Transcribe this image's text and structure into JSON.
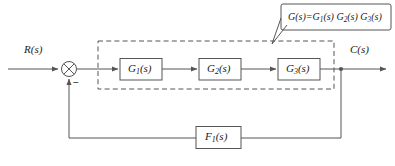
{
  "diagram": {
    "type": "control-system-block-diagram",
    "colors": {
      "line": "#555555",
      "block_border": "#555555",
      "dashed_border": "#555555",
      "text": "#1a1a1a",
      "background": "#ffffff"
    },
    "input": {
      "name": "input-signal",
      "label_html": "R(<i>s</i>)",
      "label": "R(s)"
    },
    "output": {
      "name": "output-signal",
      "label_html": "C(<i>s</i>)",
      "label": "C(s)"
    },
    "summing_junction": {
      "name": "summing-junction",
      "symbol": "crossed-circle",
      "negative_sign": "−",
      "positive_input": "R(s)",
      "negative_input": "F1(s) feedback"
    },
    "forward_blocks": [
      {
        "name": "block-g1",
        "label": "G1(s)",
        "sub": "1",
        "base": "G",
        "arg": "(s)"
      },
      {
        "name": "block-g2",
        "label": "G2(s)",
        "sub": "2",
        "base": "G",
        "arg": "(s)"
      },
      {
        "name": "block-g3",
        "label": "G3(s)",
        "sub": "3",
        "base": "G",
        "arg": "(s)"
      }
    ],
    "feedback_block": {
      "name": "block-f1",
      "label": "F1(s)",
      "sub": "1",
      "base": "F",
      "arg": "(s)"
    },
    "grouping_box": {
      "name": "dashed-grouping-box",
      "style": "dashed",
      "encloses": [
        "G1(s)",
        "G2(s)",
        "G3(s)"
      ]
    },
    "callout": {
      "name": "callout-equation",
      "equation": "G(s)=G1(s) G2(s) G3(s)",
      "parts": {
        "lhs_base": "G",
        "lhs_arg": "(s)",
        "equals": "=",
        "t1_base": "G",
        "t1_sub": "1",
        "t1_arg": "(s)",
        "t2_base": "G",
        "t2_sub": "2",
        "t2_arg": "(s)",
        "t3_base": "G",
        "t3_sub": "3",
        "t3_arg": "(s)"
      },
      "points_to": "dashed-grouping-box"
    },
    "nodes": [
      {
        "name": "output-takeoff-node",
        "type": "junction-dot"
      }
    ]
  }
}
